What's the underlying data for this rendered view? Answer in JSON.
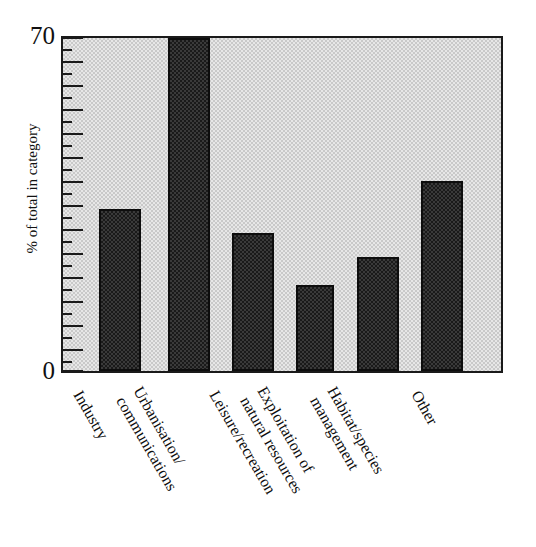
{
  "chart_data": {
    "type": "bar",
    "title": "",
    "subtitle": "",
    "xlabel": "",
    "ylabel": "% of total in category",
    "ylim": [
      0,
      70
    ],
    "ytick_labels": [
      "0",
      "70"
    ],
    "ytick_values": [
      0,
      70
    ],
    "minor_tick_interval": 2.5,
    "major_tick_interval": 5,
    "grid": false,
    "legend": null,
    "categories": [
      "Industry",
      "Urbanisation/ communications",
      "Leisure/recreation",
      "Exploitation of natural resources",
      "Habitat/species management",
      "Other"
    ],
    "values": [
      34,
      70,
      29,
      18,
      24,
      40
    ],
    "bar_color": "#3a3a3a",
    "bar_edge_color": "#0d0d0d",
    "plot_background": "#c9c9c9",
    "axis_color": "#1a1a1a"
  },
  "axis": {
    "y_title": "% of total in category",
    "y_max_label": "70",
    "y_min_label": "0"
  },
  "categories": [
    {
      "line1": "Industry",
      "line2": ""
    },
    {
      "line1": "Urbanisation/",
      "line2": "communications"
    },
    {
      "line1": "Leisure/recreation",
      "line2": ""
    },
    {
      "line1": "Exploitation of",
      "line2": "natural resources"
    },
    {
      "line1": "Habitat/species",
      "line2": "management"
    },
    {
      "line1": "Other",
      "line2": ""
    }
  ]
}
